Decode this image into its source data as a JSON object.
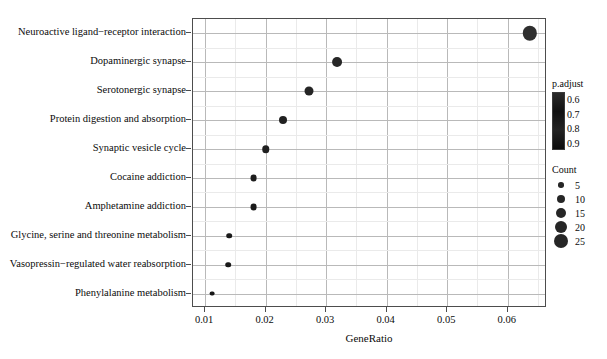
{
  "chart_data": {
    "type": "scatter",
    "title": "",
    "xlabel": "GeneRatio",
    "ylabel": "",
    "xlim": [
      0.008,
      0.0665
    ],
    "xticks": [
      0.01,
      0.02,
      0.03,
      0.04,
      0.05,
      0.06
    ],
    "xtick_labels": [
      "0.01",
      "0.02",
      "0.03",
      "0.04",
      "0.05",
      "0.06"
    ],
    "grid": true,
    "grid_minor": true,
    "legend_position": "right",
    "categories": [
      "Neuroactive ligand-receptor interaction",
      "Dopaminergic synapse",
      "Serotonergic synapse",
      "Protein digestion and absorption",
      "Synaptic vesicle cycle",
      "Cocaine addiction",
      "Amphetamine addiction",
      "Glycine, serine and threonine metabolism",
      "Vasopressin-regulated water reabsorption",
      "Phenylalanine metabolism"
    ],
    "points": [
      {
        "term": "Neuroactive ligand-receptor interaction",
        "GeneRatio": 0.0636,
        "Count": 25,
        "p.adjust": 0.62
      },
      {
        "term": "Dopaminergic synapse",
        "GeneRatio": 0.0318,
        "Count": 13,
        "p.adjust": 0.72
      },
      {
        "term": "Serotonergic synapse",
        "GeneRatio": 0.0272,
        "Count": 11,
        "p.adjust": 0.75
      },
      {
        "term": "Protein digestion and absorption",
        "GeneRatio": 0.0228,
        "Count": 9,
        "p.adjust": 0.8
      },
      {
        "term": "Synaptic vesicle cycle",
        "GeneRatio": 0.02,
        "Count": 8,
        "p.adjust": 0.83
      },
      {
        "term": "Cocaine addiction",
        "GeneRatio": 0.018,
        "Count": 7,
        "p.adjust": 0.86
      },
      {
        "term": "Amphetamine addiction",
        "GeneRatio": 0.018,
        "Count": 7,
        "p.adjust": 0.88
      },
      {
        "term": "Glycine, serine and threonine metabolism",
        "GeneRatio": 0.014,
        "Count": 5,
        "p.adjust": 0.9
      },
      {
        "term": "Vasopressin-regulated water reabsorption",
        "GeneRatio": 0.0138,
        "Count": 5,
        "p.adjust": 0.91
      },
      {
        "term": "Phenylalanine metabolism",
        "GeneRatio": 0.0112,
        "Count": 4,
        "p.adjust": 0.93
      }
    ],
    "legends": {
      "color": {
        "title": "p.adjust",
        "ticks": [
          0.6,
          0.7,
          0.8,
          0.9
        ],
        "tick_labels": [
          "0.6",
          "0.7",
          "0.8",
          "0.9"
        ],
        "low_color": "#2b2b2b",
        "high_color": "#0d0d0d"
      },
      "size": {
        "title": "Count",
        "values": [
          5,
          10,
          15,
          20,
          25
        ],
        "value_labels": [
          "5",
          "10",
          "15",
          "20",
          "25"
        ],
        "dot_color": "#262626"
      }
    }
  },
  "axes": {
    "xtitle": "GeneRatio"
  }
}
